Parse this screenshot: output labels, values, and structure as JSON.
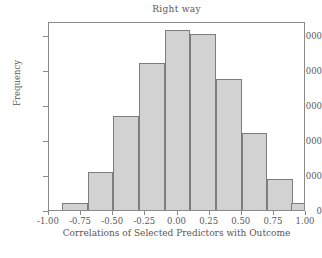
{
  "chart_data": {
    "type": "bar",
    "title": "Right way",
    "xlabel": "Correlations of Selected Predictors with Outcome",
    "ylabel": "Frequency",
    "grid": false,
    "legend": null,
    "xlim": [
      -1.0,
      1.0
    ],
    "ylim": [
      0,
      5400
    ],
    "xticks": [
      "-1.00",
      "-0.75",
      "-0.50",
      "-0.25",
      "0.00",
      "0.25",
      "0.50",
      "0.75",
      "1.00"
    ],
    "xtick_values": [
      -1.0,
      -0.75,
      -0.5,
      -0.25,
      0.0,
      0.25,
      0.5,
      0.75,
      1.0
    ],
    "yticks": [
      "0",
      "1000",
      "2000",
      "3000",
      "4000",
      "5000"
    ],
    "ytick_values": [
      0,
      1000,
      2000,
      3000,
      4000,
      5000
    ],
    "bin_edges": [
      -0.9,
      -0.7,
      -0.5,
      -0.3,
      -0.1,
      0.1,
      0.3,
      0.5,
      0.7,
      0.9,
      1.0
    ],
    "categories": [
      "-0.9 to -0.7",
      "-0.7 to -0.5",
      "-0.5 to -0.3",
      "-0.3 to -0.1",
      "-0.1 to 0.1",
      "0.1 to 0.3",
      "0.3 to 0.5",
      "0.5 to 0.7",
      "0.7 to 0.9",
      "0.9 to 1.0"
    ],
    "values": [
      200,
      1100,
      2700,
      4200,
      5150,
      5030,
      3750,
      2200,
      880,
      200
    ],
    "bars": [
      {
        "label": "-0.9 to -0.7",
        "x0": -0.9,
        "x1": -0.7,
        "value": 200
      },
      {
        "label": "-0.7 to -0.5",
        "x0": -0.7,
        "x1": -0.5,
        "value": 1100
      },
      {
        "label": "-0.5 to -0.3",
        "x0": -0.5,
        "x1": -0.3,
        "value": 2700
      },
      {
        "label": "-0.3 to -0.1",
        "x0": -0.3,
        "x1": -0.1,
        "value": 4200
      },
      {
        "label": "-0.1 to 0.1",
        "x0": -0.1,
        "x1": 0.1,
        "value": 5150
      },
      {
        "label": "0.1 to 0.3",
        "x0": 0.1,
        "x1": 0.3,
        "value": 5030
      },
      {
        "label": "0.3 to 0.5",
        "x0": 0.3,
        "x1": 0.5,
        "value": 3750
      },
      {
        "label": "0.5 to 0.7",
        "x0": 0.5,
        "x1": 0.7,
        "value": 2200
      },
      {
        "label": "0.7 to 0.9",
        "x0": 0.7,
        "x1": 0.9,
        "value": 880
      },
      {
        "label": "0.9 to 1.0",
        "x0": 0.88,
        "x1": 1.0,
        "value": 200
      }
    ],
    "colors": {
      "bar_fill": "#d2d2d2",
      "bar_edge": "#7d7d7d",
      "axis": "#8a8a8a",
      "text": "#585858",
      "background": "#ffffff"
    }
  }
}
